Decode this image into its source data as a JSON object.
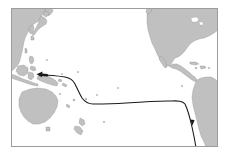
{
  "figure": {
    "kind": "map",
    "region": "Pacific Ocean basin",
    "projection_note": "equirectangular",
    "frame": {
      "x": 11,
      "y": 8,
      "width": 207,
      "height": 139,
      "border_color": "#9c9c9c",
      "border_width": 1,
      "background_color": "#ffffff"
    },
    "colors": {
      "land_fill": "#c0c0c0",
      "land_stroke": "#8e8e8e",
      "ocean_fill": "#ffffff",
      "route_stroke": "#1a1a1a",
      "page_background": "#ffffff"
    },
    "landmasses": [
      {
        "name": "asia-northeast",
        "label": "Northeast Asia"
      },
      {
        "name": "japan",
        "label": "Japan"
      },
      {
        "name": "korea-peninsula",
        "label": "Korea"
      },
      {
        "name": "philippines",
        "label": "Philippines"
      },
      {
        "name": "indonesia",
        "label": "Indonesia"
      },
      {
        "name": "new-guinea",
        "label": "New Guinea"
      },
      {
        "name": "australia",
        "label": "Australia"
      },
      {
        "name": "new-zealand",
        "label": "New Zealand"
      },
      {
        "name": "north-america",
        "label": "North America"
      },
      {
        "name": "central-america",
        "label": "Central America"
      },
      {
        "name": "caribbean-islands",
        "label": "Caribbean Islands"
      },
      {
        "name": "south-america",
        "label": "South America"
      }
    ],
    "route": {
      "name": "pacific-route",
      "stroke_color": "#1a1a1a",
      "stroke_width": 1.1,
      "direction": "east-to-west",
      "endpoints": [
        {
          "name": "route-start",
          "location": "off southwest South America",
          "x": 197,
          "y": 155
        },
        {
          "name": "route-end",
          "location": "eastern Indonesia / New Guinea",
          "x": 37,
          "y": 74
        }
      ],
      "arrowheads": [
        {
          "name": "arrowhead-terminal-west",
          "x": 39,
          "y": 74,
          "points": "west"
        },
        {
          "name": "arrowhead-midway-south",
          "x": 192,
          "y": 121,
          "points": "south"
        }
      ]
    }
  }
}
